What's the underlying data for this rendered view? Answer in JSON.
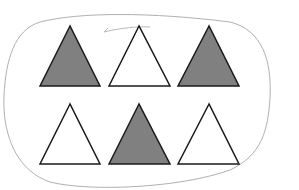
{
  "figure": {
    "colors": {
      "shaded": "#808080",
      "unshaded": "#ffffff",
      "stroke": "#1a1a1a",
      "loop": "#b0b0b0"
    },
    "rows": [
      {
        "triangles": [
          {
            "fill": "shaded"
          },
          {
            "fill": "unshaded"
          },
          {
            "fill": "shaded"
          }
        ]
      },
      {
        "triangles": [
          {
            "fill": "unshaded"
          },
          {
            "fill": "shaded"
          },
          {
            "fill": "unshaded"
          }
        ]
      }
    ],
    "counts": {
      "total": 6,
      "shaded": 3,
      "unshaded": 3
    }
  }
}
